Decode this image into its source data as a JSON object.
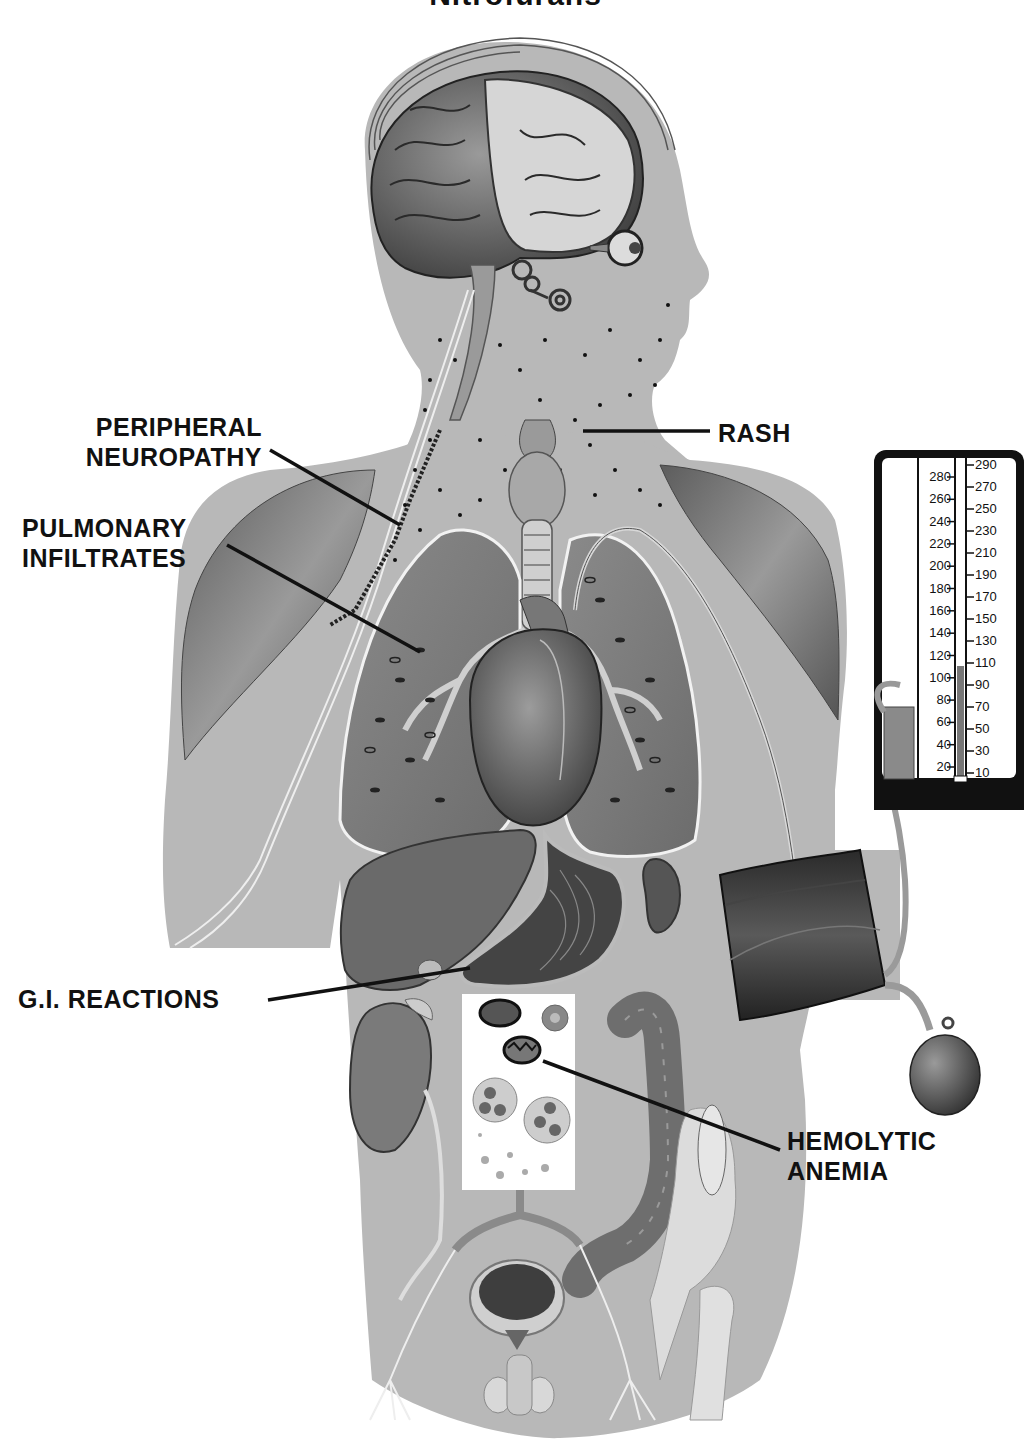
{
  "title": "Nitrofurans",
  "labels": {
    "peripheral_neuropathy": [
      "PERIPHERAL",
      "NEUROPATHY"
    ],
    "pulmonary_infiltrates": [
      "PULMONARY",
      "INFILTRATES"
    ],
    "rash": "RASH",
    "gi_reactions": "G.I. REACTIONS",
    "hemolytic_anemia": [
      "HEMOLYTIC",
      "ANEMIA"
    ]
  },
  "gauge": {
    "left_scale": [
      "280",
      "260",
      "240",
      "220",
      "200",
      "180",
      "160",
      "140",
      "120",
      "100",
      "80",
      "60",
      "40",
      "20"
    ],
    "right_scale": [
      "290",
      "270",
      "250",
      "230",
      "210",
      "190",
      "170",
      "150",
      "130",
      "110",
      "90",
      "70",
      "50",
      "30",
      "10"
    ],
    "mercury_level": "110"
  },
  "colors": {
    "background": "#ffffff",
    "silhouette": "#b8b8b8",
    "organ_dark": "#4a4a4a",
    "organ_mid": "#7a7a7a",
    "organ_light": "#d8d8d8",
    "text": "#111111",
    "gauge_frame": "#111111"
  }
}
